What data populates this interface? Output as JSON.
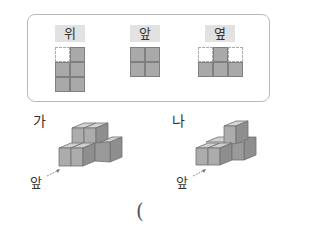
{
  "views_box": {
    "views": [
      {
        "label": "위",
        "cols": 2,
        "cells": [
          0,
          1,
          1,
          1,
          1,
          1
        ]
      },
      {
        "label": "앞",
        "cols": 2,
        "cells": [
          1,
          1,
          1,
          1
        ]
      },
      {
        "label": "옆",
        "cols": 3,
        "cells": [
          0,
          1,
          0,
          1,
          1,
          1
        ]
      }
    ]
  },
  "figures": [
    {
      "label": "가",
      "front_label": "앞"
    },
    {
      "label": "나",
      "front_label": "앞"
    }
  ],
  "answer": {
    "open_paren": "("
  },
  "colors": {
    "cube_fill": "#a9a9a9",
    "label_bg": "#e2e2e2",
    "border": "#b8b8b8"
  }
}
